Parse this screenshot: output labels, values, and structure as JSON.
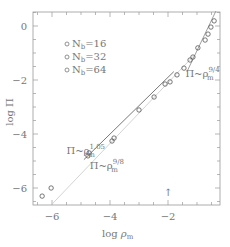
{
  "chart_data": {
    "type": "scatter",
    "title": "",
    "xlabel": "log ρm",
    "ylabel": "log Π",
    "xlim": [
      -6.6,
      -0.3
    ],
    "ylim": [
      -6.6,
      0.55
    ],
    "xticks": [
      -6,
      -4,
      -2
    ],
    "yticks": [
      0,
      -2,
      -4,
      -6
    ],
    "xtick_labels": [
      "−6",
      "−4",
      "−2"
    ],
    "ytick_labels": [
      "0",
      "−2",
      "−4",
      "−6"
    ],
    "grid": false,
    "legend_position": "upper left",
    "legend": [
      {
        "label": "N_b=16",
        "text_main": "N",
        "text_sub": "b",
        "text_tail": "=16"
      },
      {
        "label": "N_b=32",
        "text_main": "N",
        "text_sub": "b",
        "text_tail": "=32"
      },
      {
        "label": "N_b=64",
        "text_main": "N",
        "text_sub": "b",
        "text_tail": "=64"
      }
    ],
    "series": [
      {
        "name": "simulation data (N_b = 16, 32, 64)",
        "marker": "open-circle",
        "points": [
          [
            -6.34,
            -6.3
          ],
          [
            -6.03,
            -6.0
          ],
          [
            -4.76,
            -4.81
          ],
          [
            -4.72,
            -4.7
          ],
          [
            -3.93,
            -4.26
          ],
          [
            -3.86,
            -4.15
          ],
          [
            -3.0,
            -3.11
          ],
          [
            -2.48,
            -2.63
          ],
          [
            -2.1,
            -2.15
          ],
          [
            -1.93,
            -2.07
          ],
          [
            -1.69,
            -1.81
          ],
          [
            -1.45,
            -1.56
          ],
          [
            -1.24,
            -1.26
          ],
          [
            -1.14,
            -1.15
          ],
          [
            -0.97,
            -0.81
          ],
          [
            -0.72,
            -0.52
          ],
          [
            -0.62,
            -0.3
          ],
          [
            -0.52,
            -0.04
          ],
          [
            -0.41,
            0.19
          ]
        ]
      }
    ],
    "reference_lines": [
      {
        "name": "power law 1.05",
        "slope": 1.05,
        "x": [
          -4.9,
          -1.8
        ],
        "y": [
          -4.95,
          -1.69
        ],
        "color": "#555555"
      },
      {
        "name": "power law 9/8",
        "slope": 1.125,
        "x": [
          -6.0,
          -1.1
        ],
        "y": [
          -6.6,
          -1.09
        ],
        "color": "#c8c8c8"
      },
      {
        "name": "power law 9/4",
        "slope": 2.25,
        "x": [
          -1.35,
          -0.35
        ],
        "y": [
          -1.7,
          0.55
        ],
        "color": "#888888"
      }
    ],
    "annotations": [
      {
        "text": "Π~ρm^1.05",
        "base": "Π~ρ",
        "sub": "m",
        "sup": "1.05",
        "x": -5.5,
        "y": -4.75
      },
      {
        "text": "Π~ρm^9/8",
        "base": "Π~ρ",
        "sub": "m",
        "sup": "9/8",
        "x": -4.7,
        "y": -5.3
      },
      {
        "text": "Π~ρm^9/4",
        "base": "Π~ρ",
        "sub": "m",
        "sup": "9/4",
        "x": -1.4,
        "y": -1.9
      },
      {
        "text": "↑",
        "x": -2.15,
        "y": -6.3
      }
    ]
  }
}
